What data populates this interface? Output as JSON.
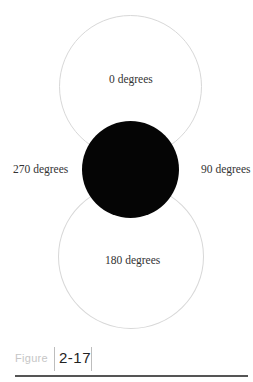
{
  "diagram": {
    "type": "rotation-angle-figure",
    "labels": {
      "top": "0 degrees",
      "right": "90 degrees",
      "bottom": "180 degrees",
      "left": "270 degrees"
    },
    "shapes": {
      "top_circle": {
        "style": "outline",
        "color": "#d8d8d8"
      },
      "center_circle": {
        "style": "filled",
        "color": "#050505"
      },
      "bottom_circle": {
        "style": "outline",
        "color": "#d8d8d8"
      }
    }
  },
  "caption": {
    "word": "Figure",
    "number": "2-17"
  }
}
